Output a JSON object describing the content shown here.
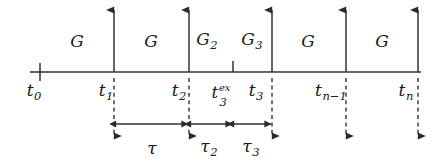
{
  "figure": {
    "kind": "timeline-diagram",
    "background_color": "#ffffff",
    "line_color": "#333333",
    "text_color": "#1a1a1a",
    "width": 443,
    "height": 166
  },
  "axis": {
    "name": "time-axis",
    "y": 72,
    "x_start": 30,
    "x_end": 421
  },
  "ticks": [
    {
      "id": "t0",
      "label_base": "t",
      "label_sub": "0",
      "label_sup": "",
      "x": 40,
      "label_x": 34,
      "marker": "tick",
      "has_up_arrow": false,
      "has_down_dashed": false
    },
    {
      "id": "t1",
      "label_base": "t",
      "label_sub": "1",
      "label_sup": "",
      "x": 114,
      "label_x": 106,
      "marker": "arrow",
      "has_up_arrow": true,
      "has_down_dashed": true
    },
    {
      "id": "t2",
      "label_base": "t",
      "label_sub": "2",
      "label_sup": "",
      "x": 189,
      "label_x": 179,
      "marker": "arrow",
      "has_up_arrow": true,
      "has_down_dashed": true
    },
    {
      "id": "t3ex",
      "label_base": "t",
      "label_sub": "3",
      "label_sup": "ex",
      "x": 233,
      "label_x": 215,
      "marker": "tick",
      "has_up_arrow": false,
      "has_down_dashed": false
    },
    {
      "id": "t3",
      "label_base": "t",
      "label_sub": "3",
      "label_sup": "",
      "x": 272,
      "label_x": 256,
      "marker": "arrow",
      "has_up_arrow": true,
      "has_down_dashed": true
    },
    {
      "id": "tn1",
      "label_base": "t",
      "label_sub": "n−1",
      "label_sup": "",
      "x": 346,
      "label_x": 331,
      "marker": "arrow",
      "has_up_arrow": true,
      "has_down_dashed": true
    },
    {
      "id": "tn",
      "label_base": "t",
      "label_sub": "n",
      "label_sup": "",
      "x": 418,
      "label_x": 406,
      "marker": "arrow",
      "has_up_arrow": true,
      "has_down_dashed": true
    }
  ],
  "intervals": [
    {
      "id": "g-1",
      "label_base": "G",
      "label_sub": "",
      "x": 77,
      "y": 41
    },
    {
      "id": "g-2",
      "label_base": "G",
      "label_sub": "",
      "x": 151,
      "y": 41
    },
    {
      "id": "g-3",
      "label_base": "G",
      "label_sub": "2",
      "x": 207,
      "y": 41
    },
    {
      "id": "g-4",
      "label_base": "G",
      "label_sub": "3",
      "x": 252,
      "y": 41
    },
    {
      "id": "g-5",
      "label_base": "G",
      "label_sub": "",
      "x": 308,
      "y": 41
    },
    {
      "id": "g-6",
      "label_base": "G",
      "label_sub": "",
      "x": 382,
      "y": 41
    }
  ],
  "durations": [
    {
      "id": "tau",
      "label_base": "τ",
      "label_sub": "",
      "x_from": 116,
      "x_to": 188,
      "y": 124,
      "label_x": 152,
      "label_y": 148
    },
    {
      "id": "tau-2",
      "label_base": "τ",
      "label_sub": "2",
      "x_from": 191,
      "x_to": 232,
      "y": 124,
      "label_x": 209,
      "label_y": 148
    },
    {
      "id": "tau-3",
      "label_base": "τ",
      "label_sub": "3",
      "x_from": 234,
      "x_to": 271,
      "y": 124,
      "label_x": 251,
      "label_y": 148
    }
  ],
  "geometry": {
    "up_arrow_top_y": 10,
    "down_arrow_bottom_y": 136,
    "tick_half_height": 9
  }
}
